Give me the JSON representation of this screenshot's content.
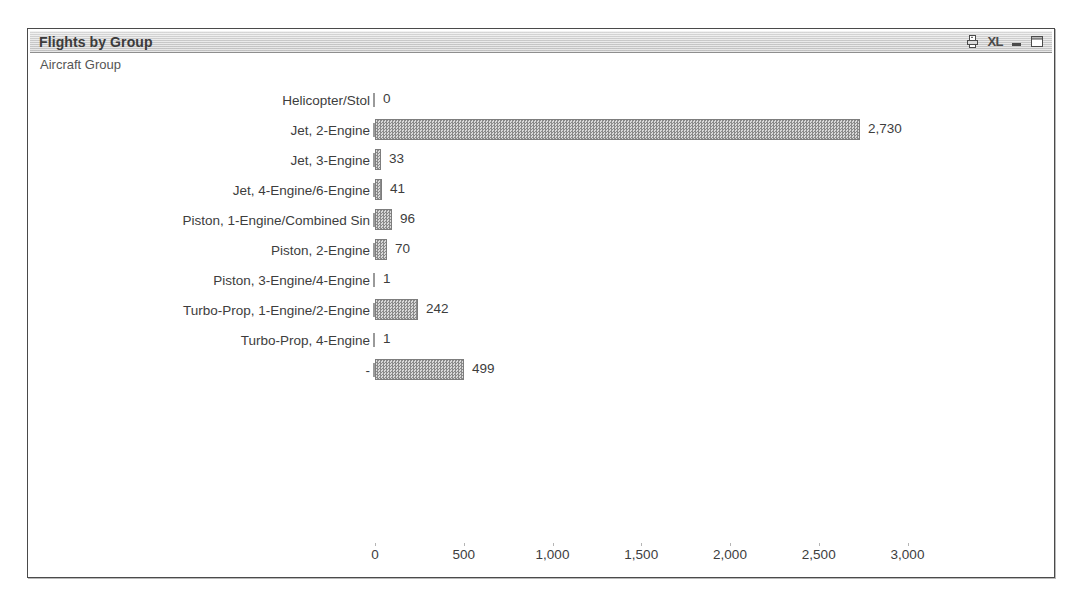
{
  "window": {
    "title": "Flights by Group",
    "buttons": [
      {
        "name": "print-report-icon",
        "label": ""
      },
      {
        "name": "export-excel-icon",
        "label": "XL"
      },
      {
        "name": "minimize-icon",
        "label": ""
      },
      {
        "name": "maximize-icon",
        "label": ""
      }
    ]
  },
  "dimension_label": "Aircraft Group",
  "colors": {
    "bar_fill": "#a6a6a6",
    "bar_border": "#7d7d7d",
    "text": "#3d3d3d",
    "titlebar": "#d2d2d2",
    "panel_border": "#4a4a4a"
  },
  "chart_data": {
    "type": "bar",
    "orientation": "horizontal",
    "title": "Flights by Group",
    "xlabel": "",
    "ylabel": "Aircraft Group",
    "xlim": [
      0,
      3000
    ],
    "xticks": [
      0,
      500,
      1000,
      1500,
      2000,
      2500,
      3000
    ],
    "xtick_labels": [
      "0",
      "500",
      "1,000",
      "1,500",
      "2,000",
      "2,500",
      "3,000"
    ],
    "grid": false,
    "legend": null,
    "categories": [
      "Helicopter/Stol",
      "Jet, 2-Engine",
      "Jet, 3-Engine",
      "Jet, 4-Engine/6-Engine",
      "Piston, 1-Engine/Combined Sin",
      "Piston, 2-Engine",
      "Piston, 3-Engine/4-Engine",
      "Turbo-Prop, 1-Engine/2-Engine",
      "Turbo-Prop, 4-Engine",
      "-"
    ],
    "values": [
      0,
      2730,
      33,
      41,
      96,
      70,
      1,
      242,
      1,
      499
    ],
    "value_labels": [
      "0",
      "2,730",
      "33",
      "41",
      "96",
      "70",
      "1",
      "242",
      "1",
      "499"
    ]
  }
}
